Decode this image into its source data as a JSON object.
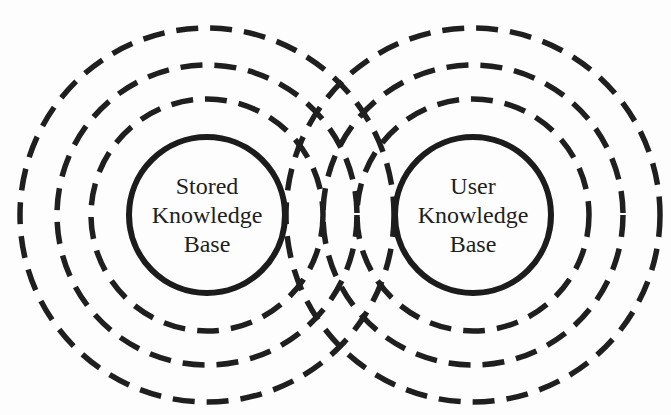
{
  "diagram": {
    "type": "concentric-overlapping-circles",
    "colors": {
      "stroke": "#1f1f1f",
      "background": "#fdfdfd",
      "text": "#1e1e1e"
    },
    "groups": [
      {
        "id": "stored",
        "center": [
          207,
          215
        ],
        "solid_radius": 78,
        "dashed_radii": [
          116,
          150,
          187
        ],
        "label_lines": [
          "Stored",
          "Knowledge",
          "Base"
        ]
      },
      {
        "id": "user",
        "center": [
          473,
          215
        ],
        "solid_radius": 78,
        "dashed_radii": [
          116,
          150,
          187
        ],
        "label_lines": [
          "User",
          "Knowledge",
          "Base"
        ]
      }
    ]
  }
}
